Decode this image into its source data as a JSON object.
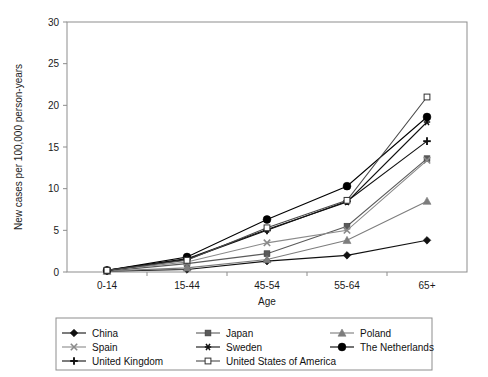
{
  "chart_data": {
    "type": "line",
    "title": "",
    "xlabel": "Age",
    "ylabel": "New cases per 100,000 person-years",
    "categories": [
      "0-14",
      "15-44",
      "45-54",
      "55-64",
      "65+"
    ],
    "yticks": [
      0,
      5,
      10,
      15,
      20,
      25,
      30
    ],
    "ylim": [
      0,
      30
    ],
    "grid": false,
    "legend_position": "bottom",
    "series": [
      {
        "name": "China",
        "marker": "diamond-filled",
        "color": "#111111",
        "values": [
          0.1,
          0.3,
          1.3,
          2.0,
          3.8
        ]
      },
      {
        "name": "Japan",
        "marker": "square-filled",
        "color": "#5a5a5a",
        "values": [
          0.1,
          1.0,
          2.2,
          5.5,
          13.6
        ]
      },
      {
        "name": "Poland",
        "marker": "triangle-filled",
        "color": "#7d7d7d",
        "values": [
          0.1,
          0.5,
          1.5,
          3.8,
          8.5
        ]
      },
      {
        "name": "Spain",
        "marker": "x-cross",
        "color": "#8a8a8a",
        "values": [
          0.2,
          1.2,
          3.5,
          5.0,
          13.4
        ]
      },
      {
        "name": "Sweden",
        "marker": "asterisk",
        "color": "#111111",
        "values": [
          0.2,
          1.6,
          5.1,
          8.4,
          18.0
        ]
      },
      {
        "name": "The Netherlands",
        "marker": "circle-filled",
        "color": "#000000",
        "values": [
          0.2,
          1.8,
          6.3,
          10.3,
          18.6
        ]
      },
      {
        "name": "United Kingdom",
        "marker": "plus",
        "color": "#111111",
        "values": [
          0.2,
          1.5,
          5.0,
          8.5,
          15.7
        ]
      },
      {
        "name": "United States of America",
        "marker": "square-open",
        "color": "#4a4a4a",
        "values": [
          0.2,
          1.4,
          5.3,
          8.6,
          21.0
        ]
      }
    ]
  },
  "axes": {
    "ylabel": "New cases per 100,000 person-years",
    "xlabel": "Age",
    "ytick_labels": [
      "0",
      "5",
      "10",
      "15",
      "20",
      "25",
      "30"
    ],
    "xtick_labels": [
      "0-14",
      "15-44",
      "45-54",
      "55-64",
      "65+"
    ]
  },
  "legend": {
    "entries": [
      {
        "label": "China"
      },
      {
        "label": "Japan"
      },
      {
        "label": "Poland"
      },
      {
        "label": "Spain"
      },
      {
        "label": "Sweden"
      },
      {
        "label": "The Netherlands"
      },
      {
        "label": "United Kingdom"
      },
      {
        "label": "United States of America"
      }
    ]
  }
}
